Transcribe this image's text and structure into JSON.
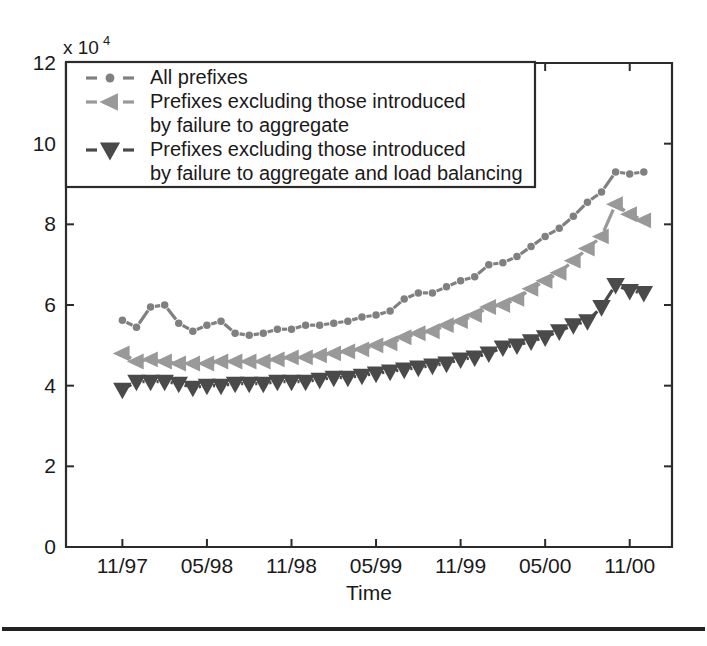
{
  "figure": {
    "background_color": "#ffffff",
    "axis_color": "#2b2b2b",
    "bottom_rule_color": "#222222"
  },
  "axes": {
    "y_exponent_prefix": "x 10",
    "y_exponent_power": "4",
    "x_axis_title": "Time",
    "y_tick_labels": [
      "0",
      "2",
      "4",
      "6",
      "8",
      "10",
      "12"
    ],
    "x_tick_labels": [
      "",
      "11/97",
      "05/98",
      "11/98",
      "05/99",
      "11/99",
      "05/00",
      "11/00"
    ]
  },
  "legend": {
    "position": "top-left-inside",
    "entries": [
      {
        "marker": "circle-marker",
        "color": "#808080",
        "lines": [
          "All prefixes"
        ]
      },
      {
        "marker": "left-triangle-marker",
        "color": "#999999",
        "lines": [
          "Prefixes excluding those introduced",
          "by failure to aggregate"
        ]
      },
      {
        "marker": "down-triangle-marker",
        "color": "#4a4a4a",
        "lines": [
          "Prefixes excluding those introduced",
          "by failure to aggregate and load balancing"
        ]
      }
    ]
  },
  "chart_data": {
    "type": "line",
    "title": "",
    "subtitle": "",
    "xlabel": "Time",
    "ylabel": "",
    "y_multiplier": 10000,
    "y_multiplier_text": "x 10^4",
    "xlim": [
      0,
      43
    ],
    "ylim": [
      0,
      12
    ],
    "y_ticks": [
      0,
      2,
      4,
      6,
      8,
      10,
      12
    ],
    "x_tick_positions": [
      0,
      4,
      10,
      16,
      22,
      28,
      34,
      40
    ],
    "x_tick_labels": [
      "",
      "11/97",
      "05/98",
      "11/98",
      "05/99",
      "11/99",
      "05/00",
      "11/00"
    ],
    "grid": false,
    "legend_position": "upper left",
    "x": [
      4,
      5,
      6,
      7,
      8,
      9,
      10,
      11,
      12,
      13,
      14,
      15,
      16,
      17,
      18,
      19,
      20,
      21,
      22,
      23,
      24,
      25,
      26,
      27,
      28,
      29,
      30,
      31,
      32,
      33,
      34,
      35,
      36,
      37,
      38,
      39,
      40,
      41
    ],
    "series": [
      {
        "name": "All prefixes",
        "marker": "circle",
        "color": "#808080",
        "linestyle": "dotted",
        "values": [
          5.62,
          5.45,
          5.95,
          6.0,
          5.55,
          5.35,
          5.5,
          5.6,
          5.3,
          5.25,
          5.3,
          5.4,
          5.4,
          5.5,
          5.5,
          5.55,
          5.6,
          5.7,
          5.75,
          5.85,
          6.15,
          6.3,
          6.3,
          6.45,
          6.6,
          6.7,
          7.0,
          7.05,
          7.2,
          7.45,
          7.7,
          7.9,
          8.2,
          8.55,
          8.8,
          9.3,
          9.25,
          9.3
        ]
      },
      {
        "name": "Prefixes excluding those introduced by failure to aggregate",
        "marker": "left-triangle",
        "color": "#999999",
        "linestyle": "dotted",
        "values": [
          4.8,
          4.6,
          4.65,
          4.6,
          4.55,
          4.55,
          4.55,
          4.6,
          4.6,
          4.6,
          4.6,
          4.65,
          4.7,
          4.7,
          4.75,
          4.8,
          4.85,
          4.9,
          5.0,
          5.05,
          5.2,
          5.3,
          5.35,
          5.5,
          5.6,
          5.75,
          5.95,
          6.0,
          6.15,
          6.4,
          6.6,
          6.8,
          7.1,
          7.4,
          7.7,
          8.5,
          8.25,
          8.1
        ]
      },
      {
        "name": "Prefixes excluding those introduced by failure to aggregate and load balancing",
        "marker": "down-triangle",
        "color": "#4a4a4a",
        "linestyle": "dotted",
        "values": [
          3.9,
          4.1,
          4.1,
          4.1,
          4.05,
          3.95,
          4.0,
          4.0,
          4.05,
          4.05,
          4.05,
          4.1,
          4.1,
          4.1,
          4.15,
          4.2,
          4.2,
          4.25,
          4.3,
          4.35,
          4.4,
          4.45,
          4.5,
          4.55,
          4.65,
          4.7,
          4.8,
          4.95,
          5.0,
          5.1,
          5.2,
          5.35,
          5.5,
          5.6,
          5.95,
          6.5,
          6.35,
          6.3
        ]
      }
    ]
  }
}
